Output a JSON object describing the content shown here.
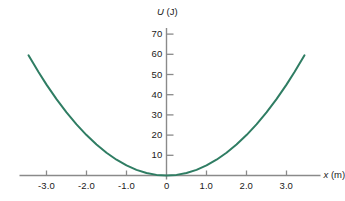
{
  "figure": {
    "background_color": "#ffffff",
    "axis_color": "#8a8a8a",
    "text_color": "#1a1a1a",
    "curve_color": "#2f7d63",
    "curve_width": 2.0
  },
  "chart_data": {
    "type": "line",
    "title": "",
    "subtitle": "",
    "xlabel": "x (m)",
    "xlabel_symbol": "x",
    "xlabel_unit": "(m)",
    "ylabel": "U (J)",
    "ylabel_symbol": "U",
    "ylabel_unit": "(J)",
    "grid": false,
    "legend": null,
    "xlim": [
      -3.6,
      3.6
    ],
    "ylim": [
      0,
      75
    ],
    "xticks": [
      -3.0,
      -2.0,
      -1.0,
      0,
      1.0,
      2.0,
      3.0
    ],
    "xtick_labels": [
      "-3.0",
      "-2.0",
      "-1.0",
      "0",
      "1.0",
      "2.0",
      "3.0"
    ],
    "yticks": [
      10,
      20,
      30,
      40,
      50,
      60,
      70
    ],
    "ytick_labels": [
      "10",
      "20",
      "30",
      "40",
      "50",
      "60",
      "70"
    ],
    "equation": "U = 5x^2",
    "series": [
      {
        "name": "U(x)",
        "color": "#2f7d63",
        "x": [
          -3.45,
          -3.2,
          -3.0,
          -2.75,
          -2.5,
          -2.25,
          -2.0,
          -1.75,
          -1.5,
          -1.25,
          -1.0,
          -0.75,
          -0.5,
          -0.25,
          0,
          0.25,
          0.5,
          0.75,
          1.0,
          1.25,
          1.5,
          1.75,
          2.0,
          2.25,
          2.5,
          2.75,
          3.0,
          3.2,
          3.45
        ],
        "y": [
          59.5,
          51.2,
          45.0,
          37.8,
          31.25,
          25.3,
          20.0,
          15.3,
          11.25,
          7.8,
          5.0,
          2.8,
          1.25,
          0.3,
          0,
          0.3,
          1.25,
          2.8,
          5.0,
          7.8,
          11.25,
          15.3,
          20.0,
          25.3,
          31.25,
          37.8,
          45.0,
          51.2,
          59.5
        ]
      }
    ]
  }
}
